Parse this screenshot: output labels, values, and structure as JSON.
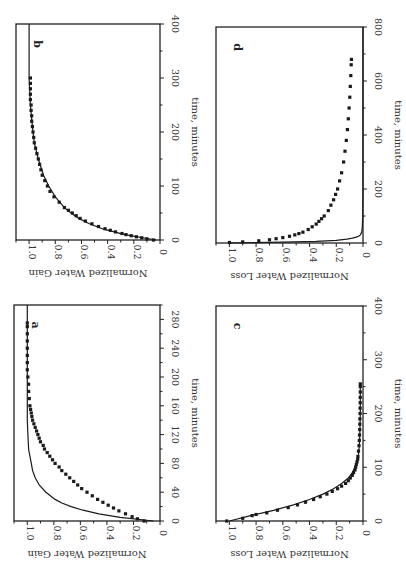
{
  "chart_data": [
    {
      "panel": "a",
      "type": "scatter",
      "xlabel": "time, minutes",
      "ylabel": "Normalized Water Gain",
      "xlim": [
        0,
        300
      ],
      "ylim": [
        0,
        1.1
      ],
      "xticks": [
        0,
        40,
        80,
        120,
        160,
        200,
        240,
        280
      ],
      "yticks": [
        0,
        0.2,
        0.4,
        0.6,
        0.8,
        1.0
      ],
      "frame": {
        "left": 14,
        "right": 160,
        "top": 305,
        "bottom": 521
      },
      "series": [
        {
          "name": "data",
          "kind": "points",
          "x": [
            0,
            3,
            6,
            10,
            14,
            18,
            22,
            26,
            30,
            35,
            40,
            45,
            50,
            55,
            60,
            65,
            70,
            75,
            80,
            85,
            90,
            95,
            100,
            105,
            110,
            115,
            120,
            125,
            130,
            135,
            140,
            145,
            150,
            155,
            160,
            170,
            180,
            190,
            200,
            210,
            220,
            230,
            240,
            250,
            260,
            270,
            275
          ],
          "y": [
            0.12,
            0.17,
            0.21,
            0.26,
            0.31,
            0.35,
            0.39,
            0.43,
            0.47,
            0.51,
            0.55,
            0.59,
            0.62,
            0.65,
            0.68,
            0.71,
            0.74,
            0.76,
            0.79,
            0.81,
            0.83,
            0.85,
            0.87,
            0.88,
            0.9,
            0.91,
            0.92,
            0.93,
            0.94,
            0.95,
            0.96,
            0.965,
            0.97,
            0.975,
            0.98,
            0.985,
            0.99,
            0.99,
            0.995,
            1.0,
            1.0,
            1.0,
            1.0,
            1.0,
            1.0,
            1.0,
            1.0
          ]
        },
        {
          "name": "model",
          "kind": "line",
          "x": [
            0,
            5,
            10,
            15,
            20,
            25,
            30,
            40,
            50,
            60,
            70,
            80,
            90,
            100,
            120,
            140,
            160,
            200,
            240,
            280,
            300
          ],
          "y": [
            0.05,
            0.3,
            0.46,
            0.58,
            0.67,
            0.74,
            0.79,
            0.86,
            0.91,
            0.94,
            0.96,
            0.97,
            0.98,
            0.99,
            0.995,
            1.0,
            1.0,
            1.0,
            1.0,
            1.0,
            1.0
          ]
        }
      ]
    },
    {
      "panel": "b",
      "type": "scatter",
      "xlabel": "time, minutes",
      "ylabel": "Normalized Water Gain",
      "xlim": [
        0,
        400
      ],
      "ylim": [
        0,
        1.1
      ],
      "xticks": [
        0,
        100,
        200,
        300,
        400
      ],
      "yticks": [
        0,
        0.2,
        0.4,
        0.6,
        0.8,
        1.0
      ],
      "frame": {
        "left": 16,
        "right": 160,
        "top": 24,
        "bottom": 240
      },
      "series": [
        {
          "name": "data",
          "kind": "points",
          "x": [
            0,
            2,
            4,
            6,
            8,
            10,
            12,
            15,
            18,
            21,
            25,
            30,
            35,
            40,
            45,
            50,
            55,
            60,
            70,
            80,
            90,
            100,
            110,
            120,
            130,
            140,
            150,
            160,
            170,
            180,
            190,
            200,
            210,
            220,
            230,
            240,
            250,
            260,
            270,
            280,
            290,
            300
          ],
          "y": [
            0.05,
            0.1,
            0.14,
            0.18,
            0.22,
            0.26,
            0.29,
            0.34,
            0.38,
            0.42,
            0.47,
            0.52,
            0.57,
            0.61,
            0.64,
            0.67,
            0.7,
            0.73,
            0.77,
            0.81,
            0.84,
            0.86,
            0.88,
            0.9,
            0.91,
            0.92,
            0.93,
            0.94,
            0.95,
            0.96,
            0.965,
            0.97,
            0.975,
            0.98,
            0.98,
            0.985,
            0.985,
            0.99,
            0.99,
            0.99,
            0.99,
            0.99
          ]
        },
        {
          "name": "model",
          "kind": "line",
          "x": [
            0,
            10,
            20,
            30,
            40,
            50,
            60,
            80,
            100,
            120,
            150,
            180,
            210,
            250,
            300,
            350,
            400
          ],
          "y": [
            0.03,
            0.27,
            0.43,
            0.54,
            0.62,
            0.68,
            0.73,
            0.8,
            0.85,
            0.89,
            0.93,
            0.96,
            0.975,
            0.99,
            1.0,
            1.0,
            1.0
          ]
        }
      ]
    },
    {
      "panel": "c",
      "type": "scatter",
      "xlabel": "time, minutes",
      "ylabel": "Normalized Water Loss",
      "xlim": [
        0,
        400
      ],
      "ylim": [
        0,
        1.1
      ],
      "xticks": [
        0,
        100,
        200,
        300,
        400
      ],
      "yticks": [
        0,
        0.2,
        0.4,
        0.6,
        0.8,
        1.0
      ],
      "frame": {
        "left": 216,
        "right": 363,
        "top": 306,
        "bottom": 521
      },
      "series": [
        {
          "name": "data",
          "kind": "points",
          "x": [
            0,
            5,
            10,
            12,
            15,
            20,
            25,
            30,
            35,
            40,
            45,
            50,
            55,
            60,
            65,
            70,
            75,
            80,
            85,
            90,
            95,
            100,
            105,
            110,
            115,
            120,
            130,
            140,
            150,
            160,
            170,
            180,
            190,
            200,
            210,
            220,
            230,
            240,
            250,
            255
          ],
          "y": [
            1.02,
            0.9,
            0.83,
            0.8,
            0.72,
            0.64,
            0.56,
            0.49,
            0.43,
            0.37,
            0.32,
            0.27,
            0.23,
            0.19,
            0.16,
            0.13,
            0.11,
            0.095,
            0.08,
            0.07,
            0.06,
            0.055,
            0.05,
            0.045,
            0.04,
            0.038,
            0.034,
            0.03,
            0.028,
            0.026,
            0.025,
            0.024,
            0.023,
            0.022,
            0.022,
            0.021,
            0.021,
            0.02,
            0.02,
            0.02
          ]
        },
        {
          "name": "model",
          "kind": "line",
          "x": [
            0,
            10,
            20,
            30,
            40,
            50,
            60,
            70,
            80,
            90,
            100,
            110,
            120,
            140,
            160,
            200,
            250
          ],
          "y": [
            1.0,
            0.84,
            0.67,
            0.52,
            0.4,
            0.3,
            0.22,
            0.16,
            0.11,
            0.08,
            0.06,
            0.045,
            0.035,
            0.028,
            0.024,
            0.02,
            0.02
          ]
        }
      ]
    },
    {
      "panel": "d",
      "type": "scatter",
      "xlabel": "time, minutes",
      "ylabel": "Normalized Water Loss",
      "xlim": [
        0,
        800
      ],
      "ylim": [
        0,
        1.1
      ],
      "xticks": [
        0,
        200,
        400,
        600,
        800
      ],
      "yticks": [
        0,
        0.2,
        0.4,
        0.6,
        0.8,
        1.0
      ],
      "frame": {
        "left": 216,
        "right": 363,
        "top": 27,
        "bottom": 243
      },
      "series": [
        {
          "name": "data",
          "kind": "points",
          "x": [
            2,
            4,
            8,
            12,
            16,
            20,
            25,
            30,
            35,
            40,
            50,
            60,
            70,
            80,
            90,
            100,
            120,
            140,
            160,
            180,
            200,
            230,
            260,
            300,
            340,
            380,
            420,
            460,
            500,
            540,
            580,
            620,
            660,
            680
          ],
          "y": [
            1.0,
            0.9,
            0.78,
            0.7,
            0.65,
            0.6,
            0.55,
            0.51,
            0.48,
            0.45,
            0.41,
            0.38,
            0.35,
            0.33,
            0.31,
            0.29,
            0.26,
            0.24,
            0.22,
            0.205,
            0.19,
            0.175,
            0.16,
            0.145,
            0.135,
            0.125,
            0.117,
            0.11,
            0.104,
            0.099,
            0.095,
            0.091,
            0.088,
            0.087
          ]
        },
        {
          "name": "model",
          "kind": "line",
          "x": [
            0,
            3,
            6,
            10,
            14,
            18,
            22,
            26,
            30,
            40,
            60,
            100,
            200,
            400,
            800
          ],
          "y": [
            1.0,
            0.6,
            0.35,
            0.2,
            0.12,
            0.08,
            0.05,
            0.03,
            0.02,
            0.01,
            0.005,
            0.002,
            0.0,
            0.0,
            0.0
          ]
        }
      ]
    }
  ]
}
